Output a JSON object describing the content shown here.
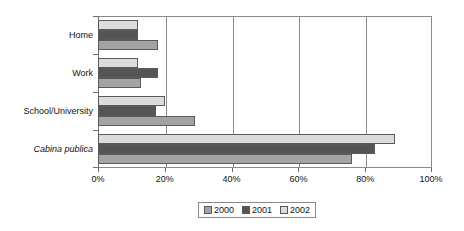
{
  "chart_data": {
    "type": "bar",
    "orientation": "horizontal",
    "title": "",
    "subtitle": "",
    "xlabel": "",
    "ylabel": "",
    "xlim": [
      0,
      100
    ],
    "xticks": [
      "0%",
      "20%",
      "40%",
      "60%",
      "80%",
      "100%"
    ],
    "xtick_values": [
      0,
      20,
      40,
      60,
      80,
      100
    ],
    "grid": true,
    "grid_axis": "x",
    "legend_position": "bottom",
    "categories": [
      "Home",
      "Work",
      "School/University",
      "Cabina publica"
    ],
    "category_styles": [
      "normal",
      "normal",
      "normal",
      "italic"
    ],
    "series": [
      {
        "name": "2000",
        "color": "#a3a3a3",
        "values": [
          18,
          13,
          29,
          76
        ]
      },
      {
        "name": "2001",
        "color": "#555555",
        "values": [
          12,
          18,
          17.5,
          83
        ]
      },
      {
        "name": "2002",
        "color": "#dcdcdc",
        "values": [
          12,
          12,
          20,
          89
        ]
      }
    ],
    "series_draw_order_top_to_bottom": [
      "2002",
      "2001",
      "2000"
    ]
  },
  "legend": {
    "items": [
      {
        "label": "2000",
        "color": "#a3a3a3"
      },
      {
        "label": "2001",
        "color": "#555555"
      },
      {
        "label": "2002",
        "color": "#dcdcdc"
      }
    ]
  },
  "axis": {
    "x_tick_labels": [
      "0%",
      "20%",
      "40%",
      "60%",
      "80%",
      "100%"
    ]
  },
  "categories": [
    {
      "label": "Home"
    },
    {
      "label": "Work"
    },
    {
      "label": "School/University"
    },
    {
      "label": "Cabina publica"
    }
  ]
}
